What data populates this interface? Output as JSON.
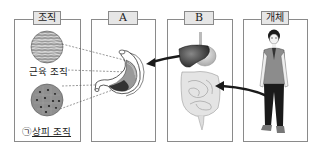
{
  "panels": [
    {
      "id": "tissue",
      "label": "조직"
    },
    {
      "id": "A",
      "label": "A"
    },
    {
      "id": "B",
      "label": "B"
    },
    {
      "id": "individual",
      "label": "개체"
    }
  ],
  "tissue_panel": {
    "muscle_label": "근육 조직",
    "epithelial_marker": "㉠",
    "epithelial_label": "상피 조직"
  },
  "illustrations": {
    "panel_A": "stomach-organ",
    "panel_B": "digestive-system",
    "panel_individual": "person-standing"
  },
  "colors": {
    "border": "#8a8a8a",
    "label_bg": "#e6e6e6",
    "arrow": "#1a1a1a"
  }
}
